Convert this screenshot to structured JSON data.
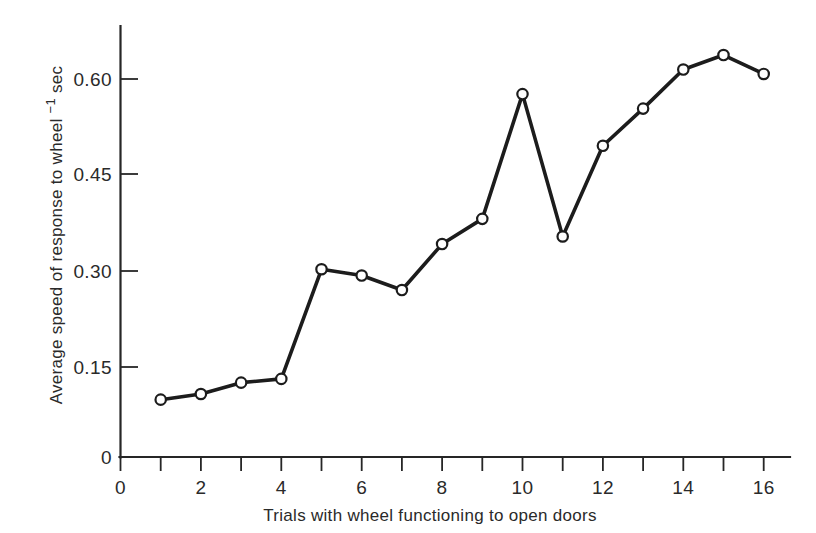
{
  "figure": {
    "background": "#ffffff",
    "line_color": "#1c1c1c",
    "marker_fill": "#ffffff",
    "axis_color": "#262626",
    "text_color": "#2a2a2a"
  },
  "axes": {
    "y_title_main": "Average speed of response to wheel ",
    "y_title_exponent": "−1",
    "y_title_unit": " sec",
    "y_title_full": "Average speed of response to wheel −1 sec",
    "x_title": "Trials with wheel  functioning to open doors",
    "y_ticks": [
      "0",
      "0.15",
      "0.30",
      "0.45",
      "0.60"
    ],
    "x_ticks": [
      "0",
      "2",
      "4",
      "6",
      "8",
      "10",
      "12",
      "14",
      "16"
    ]
  },
  "chart_data": {
    "type": "line",
    "title": "",
    "xlabel": "Trials with wheel  functioning to open doors",
    "ylabel": "Average speed of response to wheel −1 sec",
    "x": [
      1,
      2,
      3,
      4,
      5,
      6,
      7,
      8,
      9,
      10,
      11,
      12,
      13,
      14,
      15,
      16
    ],
    "values": [
      0.091,
      0.1,
      0.118,
      0.124,
      0.298,
      0.288,
      0.265,
      0.338,
      0.378,
      0.576,
      0.35,
      0.494,
      0.553,
      0.615,
      0.638,
      0.608
    ],
    "xlim": [
      0,
      16.7
    ],
    "ylim": [
      0,
      0.685
    ],
    "x_major_ticks": [
      0,
      2,
      4,
      6,
      8,
      10,
      12,
      14,
      16
    ],
    "x_minor_ticks": [
      1,
      3,
      5,
      7,
      9,
      11,
      13,
      15
    ],
    "y_major_ticks": [
      0,
      0.15,
      0.3,
      0.45,
      0.6
    ],
    "grid": false,
    "legend": null,
    "marker": "open-circle",
    "series_name": "Average speed of response"
  }
}
